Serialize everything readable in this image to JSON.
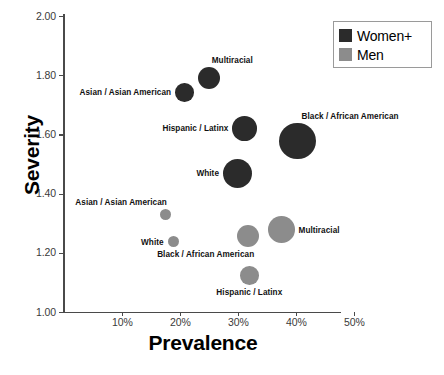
{
  "chart_data": {
    "type": "scatter",
    "title": "",
    "xlabel": "Prevalence",
    "ylabel": "Severity",
    "xlim": [
      0.0,
      0.55
    ],
    "ylim": [
      1.0,
      2.0
    ],
    "xticks": [
      "10%",
      "20%",
      "30%",
      "40%",
      "50%"
    ],
    "xtick_values": [
      0.1,
      0.2,
      0.3,
      0.4,
      0.5
    ],
    "yticks": [
      "1.00",
      "1.20",
      "1.40",
      "1.60",
      "1.80",
      "2.00"
    ],
    "ytick_values": [
      1.0,
      1.2,
      1.4,
      1.6,
      1.8,
      2.0
    ],
    "grid": false,
    "legend_position": "top-right",
    "legend": [
      {
        "name": "Women+",
        "color": "#2b2b2b"
      },
      {
        "name": "Men",
        "color": "#8c8c8c"
      }
    ],
    "series": [
      {
        "name": "Women+",
        "color": "#2b2b2b",
        "points": [
          {
            "label": "Multiracial",
            "x": 0.25,
            "y": 1.79,
            "size": 11.0,
            "label_pos": "above-right"
          },
          {
            "label": "Asian  / Asian American",
            "x": 0.207,
            "y": 1.742,
            "size": 9.3,
            "label_pos": "left"
          },
          {
            "label": "Hispanic / Latinx",
            "x": 0.311,
            "y": 1.62,
            "size": 12.3,
            "label_pos": "left"
          },
          {
            "label": "Black / African American",
            "x": 0.402,
            "y": 1.578,
            "size": 18.3,
            "label_pos": "above-right"
          },
          {
            "label": "White",
            "x": 0.299,
            "y": 1.468,
            "size": 14.7,
            "label_pos": "left"
          }
        ]
      },
      {
        "name": "Men",
        "color": "#8c8c8c",
        "points": [
          {
            "label": "Asian  / Asian American",
            "x": 0.174,
            "y": 1.328,
            "size": 5.5,
            "label_pos": "above-left"
          },
          {
            "label": "White",
            "x": 0.188,
            "y": 1.238,
            "size": 5.7,
            "label_pos": "left"
          },
          {
            "label": "Multiracial",
            "x": 0.374,
            "y": 1.278,
            "size": 13.3,
            "label_pos": "right"
          },
          {
            "label": "Black / African American",
            "x": 0.317,
            "y": 1.258,
            "size": 11.0,
            "label_pos": "below-left"
          },
          {
            "label": "Hispanic / Latinx",
            "x": 0.319,
            "y": 1.124,
            "size": 9.3,
            "label_pos": "below"
          }
        ]
      }
    ]
  }
}
